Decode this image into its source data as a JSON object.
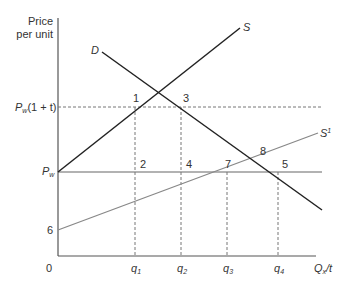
{
  "axes": {
    "y_label_line1": "Price",
    "y_label_line2": "per unit",
    "x_label": "Q",
    "x_label_sub": "x",
    "x_label_suffix": "/t",
    "origin": "0"
  },
  "y_ticks": {
    "pw_t": {
      "main": "P",
      "sub": "w",
      "suffix": "(1 + t)"
    },
    "pw": {
      "main": "P",
      "sub": "w"
    },
    "six": "6"
  },
  "x_ticks": [
    {
      "main": "q",
      "sub": "1"
    },
    {
      "main": "q",
      "sub": "2"
    },
    {
      "main": "q",
      "sub": "3"
    },
    {
      "main": "q",
      "sub": "4"
    }
  ],
  "curves": {
    "demand": "D",
    "supply": "S",
    "supply_prime": "S",
    "supply_prime_sup": "1"
  },
  "points": [
    "1",
    "2",
    "3",
    "4",
    "5",
    "6",
    "7",
    "8"
  ],
  "colors": {
    "axis": "#555555",
    "dark_line": "#222222",
    "gray_line": "#888888",
    "dashed": "#777777"
  }
}
